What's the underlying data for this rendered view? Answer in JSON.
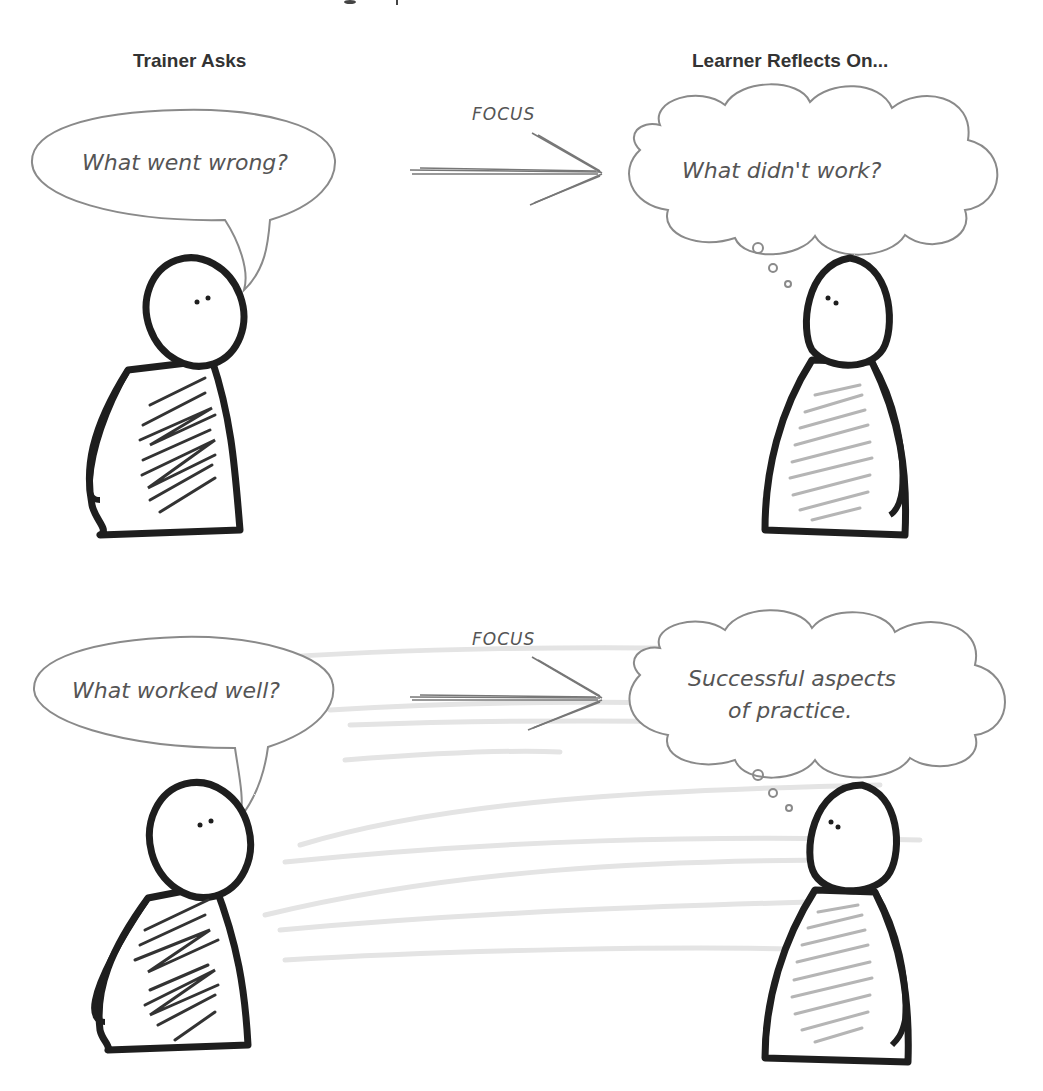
{
  "headers": {
    "left": "Trainer Asks",
    "right": "Learner Reflects On..."
  },
  "panels": [
    {
      "trainer_question": "What went wrong?",
      "arrow_label": "FOCUS",
      "learner_thought": [
        "What didn't work?"
      ]
    },
    {
      "trainer_question": "What worked well?",
      "arrow_label": "FOCUS",
      "learner_thought": [
        "Successful aspects",
        "of practice."
      ]
    }
  ],
  "colors": {
    "outline": "#1e1e1e",
    "bubble_stroke": "#8a8a8a",
    "hand_text": "#555555",
    "dark_hatch": "#333333",
    "light_hatch": "#b5b5b5",
    "header_text": "#333333"
  }
}
